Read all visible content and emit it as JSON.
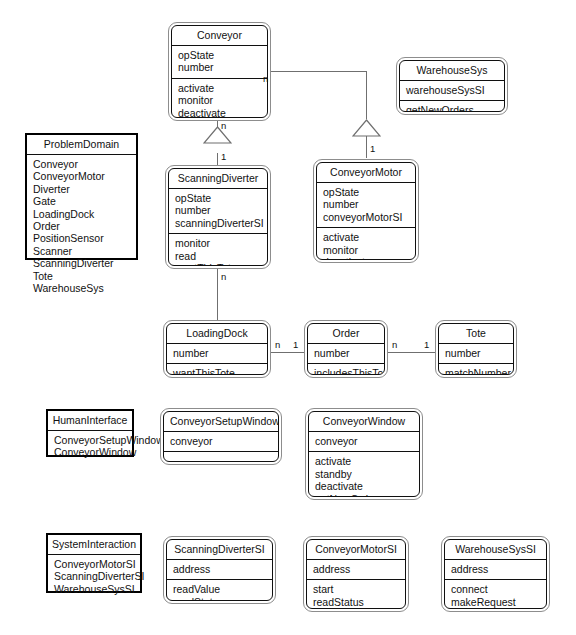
{
  "diagram": {
    "caption": "",
    "line_color": "#6f6f6f",
    "border_color": "#101010"
  },
  "classes": {
    "conveyor": {
      "name": "Conveyor",
      "attributes": [
        "opState",
        "number"
      ],
      "operations": [
        "activate",
        "monitor",
        "deactivate"
      ]
    },
    "warehouse_sys": {
      "name": "WarehouseSys",
      "attributes": [
        "warehouseSysSI"
      ],
      "operations": [
        "getNewOrders"
      ]
    },
    "scanning_diverter": {
      "name": "ScanningDiverter",
      "attributes": [
        "opState",
        "number",
        "scanningDiverterSI"
      ],
      "operations": [
        "monitor",
        "read",
        "wantThisTote",
        "divert"
      ]
    },
    "conveyor_motor": {
      "name": "ConveyorMotor",
      "attributes": [
        "opState",
        "number",
        "conveyorMotorSI"
      ],
      "operations": [
        "activate",
        "monitor",
        "deactivate"
      ]
    },
    "loading_dock": {
      "name": "LoadingDock",
      "attributes": [
        "number"
      ],
      "operations": [
        "wantThisTote"
      ]
    },
    "order": {
      "name": "Order",
      "attributes": [
        "number"
      ],
      "operations": [
        "includesThisTote"
      ]
    },
    "tote": {
      "name": "Tote",
      "attributes": [
        "number"
      ],
      "operations": [
        "matchNumber"
      ]
    },
    "conveyor_setup_window": {
      "name": "ConveyorSetupWindow",
      "attributes": [
        "conveyor"
      ],
      "operations": []
    },
    "conveyor_window": {
      "name": "ConveyorWindow",
      "attributes": [
        "conveyor"
      ],
      "operations": [
        "activate",
        "standby",
        "deactivate",
        "getNewOrders",
        "setup"
      ]
    },
    "scanning_diverter_si": {
      "name": "ScanningDiverterSI",
      "attributes": [
        "address"
      ],
      "operations": [
        "readValue",
        "readStatus"
      ]
    },
    "conveyor_motor_si": {
      "name": "ConveyorMotorSI",
      "attributes": [
        "address"
      ],
      "operations": [
        "start",
        "readStatus",
        "stop"
      ]
    },
    "warehouse_sys_si": {
      "name": "WarehouseSysSI",
      "attributes": [
        "address"
      ],
      "operations": [
        "connect",
        "makeRequest",
        "disconnect"
      ]
    }
  },
  "packages": {
    "problem_domain": {
      "name": "ProblemDomain",
      "items": [
        "Conveyor",
        "ConveyorMotor",
        "Diverter",
        "Gate",
        "LoadingDock",
        "Order",
        "PositionSensor",
        "Scanner",
        "ScanningDiverter",
        "Tote",
        "WarehouseSys"
      ]
    },
    "human_interface": {
      "name": "HumanInterface",
      "items": [
        "ConveyorSetupWindow",
        "ConveyorWindow"
      ]
    },
    "system_interaction": {
      "name": "SystemInteraction",
      "items": [
        "ConveyorMotorSI",
        "ScanningDiverterSI",
        "WarehouseSysSI"
      ]
    }
  },
  "multiplicities": {
    "conveyor_right_n": "n",
    "conveyor_bottom_n": "n",
    "scanning_diverter_top_1": "1",
    "conveyor_motor_top_1": "1",
    "scanning_diverter_bottom_n": "n",
    "loading_dock_right_n": "n",
    "order_left_1": "1",
    "order_right_n": "n",
    "tote_left_1": "1"
  }
}
